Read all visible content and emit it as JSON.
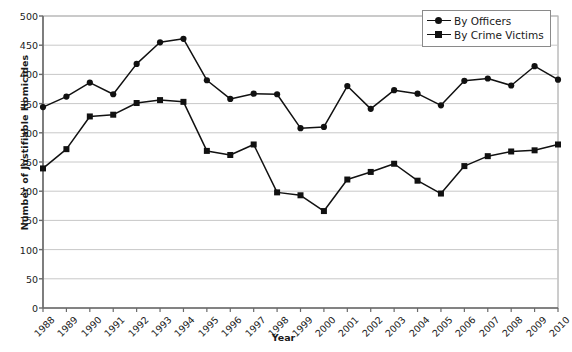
{
  "chart_data": {
    "type": "line",
    "title": "",
    "xlabel": "Year",
    "ylabel": "Number of Justifiable Homicides",
    "ylim": [
      0,
      500
    ],
    "ytick_step": 50,
    "yticks": [
      0,
      50,
      100,
      150,
      200,
      250,
      300,
      350,
      400,
      450,
      500
    ],
    "grid": "horizontal",
    "legend_position": "top-right",
    "categories": [
      "1988",
      "1989",
      "1990",
      "1991",
      "1992",
      "1993",
      "1994",
      "1995",
      "1996",
      "1997",
      "1998",
      "1999",
      "2000",
      "2001",
      "2002",
      "2003",
      "2004",
      "2005",
      "2006",
      "2007",
      "2008",
      "2009",
      "2010"
    ],
    "series": [
      {
        "name": "By Officers",
        "marker": "circle",
        "color": "#111111",
        "values": [
          344,
          362,
          386,
          366,
          418,
          455,
          461,
          390,
          358,
          367,
          366,
          308,
          310,
          380,
          341,
          373,
          367,
          347,
          389,
          393,
          381,
          414,
          391
        ]
      },
      {
        "name": "By Crime Victims",
        "marker": "square",
        "color": "#111111",
        "values": [
          239,
          272,
          328,
          331,
          351,
          356,
          353,
          269,
          262,
          280,
          198,
          193,
          166,
          220,
          233,
          247,
          218,
          196,
          243,
          260,
          268,
          270,
          280
        ]
      }
    ]
  },
  "legend": {
    "items": [
      {
        "label": "By Officers",
        "marker": "circle"
      },
      {
        "label": "By Crime Victims",
        "marker": "square"
      }
    ]
  }
}
